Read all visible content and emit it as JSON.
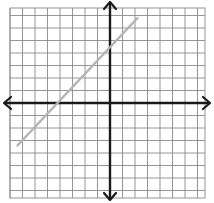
{
  "chart_data": {
    "type": "line",
    "title": "",
    "xlabel": "",
    "ylabel": "",
    "xlim": [
      -8,
      8
    ],
    "ylim": [
      -8,
      8
    ],
    "grid": true,
    "grid_step": 1,
    "axes_arrows": true,
    "series": [
      {
        "name": "line",
        "color": "#b3b3b3",
        "x": [
          -7.4,
          2.2
        ],
        "y": [
          -3.4,
          6.8
        ],
        "equation": "y = x + 4"
      }
    ]
  },
  "colors": {
    "grid": "#8a8a8a",
    "axes": "#1a1a1a",
    "line": "#b3b3b3",
    "background": "#ffffff"
  }
}
